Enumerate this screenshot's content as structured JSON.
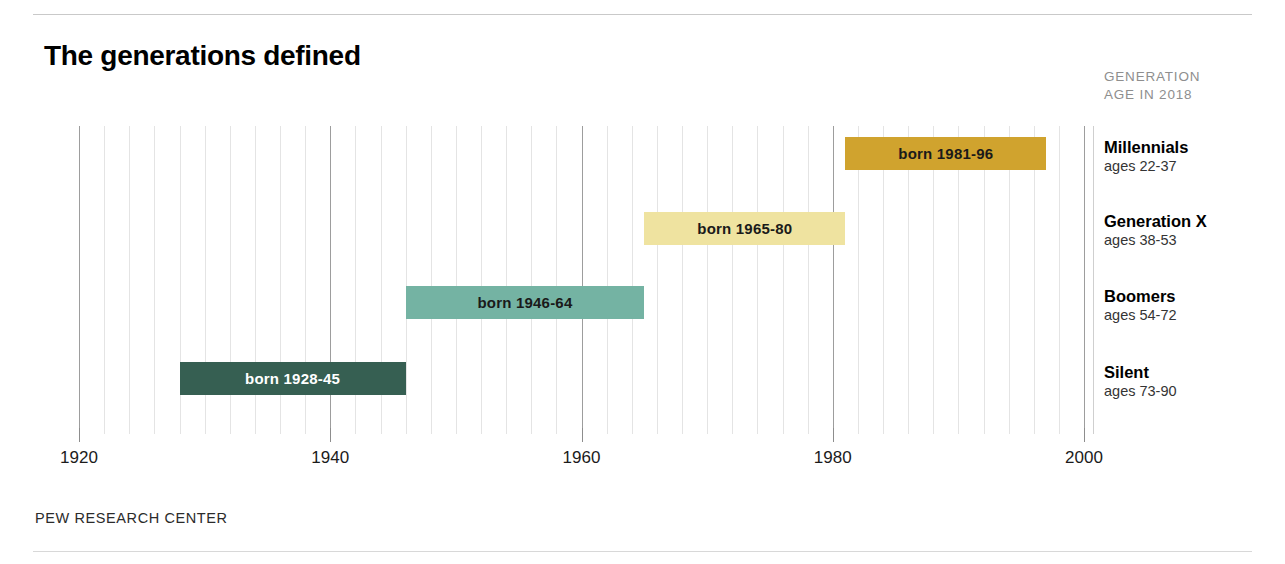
{
  "header": {
    "title": "The generations defined",
    "column_header_line1": "GENERATION",
    "column_header_line2": "AGE IN 2018"
  },
  "footer": {
    "source": "PEW RESEARCH CENTER"
  },
  "chart_data": {
    "type": "bar",
    "orientation": "horizontal",
    "title": "The generations defined",
    "xlabel": "",
    "ylabel": "",
    "xlim": [
      1920,
      2000
    ],
    "xticks": [
      1920,
      1940,
      1960,
      1980,
      2000
    ],
    "xtick_labels": [
      "1920",
      "1940",
      "1960",
      "1980",
      "2000"
    ],
    "grid": true,
    "grid_minor_step": 2,
    "grid_major_step": 20,
    "legend": "none",
    "categories": [
      "Millennials",
      "Generation X",
      "Boomers",
      "Silent"
    ],
    "bars": [
      {
        "generation": "Millennials",
        "label": "born 1981-96",
        "start": 1981,
        "end": 1996,
        "ages": "ages 22-37",
        "color": "#d0a32e",
        "text_color": "#1a1a1a"
      },
      {
        "generation": "Generation X",
        "label": "born 1965-80",
        "start": 1965,
        "end": 1980,
        "ages": "ages 38-53",
        "color": "#efe3a0",
        "text_color": "#1a1a1a"
      },
      {
        "generation": "Boomers",
        "label": "born 1946-64",
        "start": 1946,
        "end": 1964,
        "ages": "ages 54-72",
        "color": "#74b3a3",
        "text_color": "#1a1a1a"
      },
      {
        "generation": "Silent",
        "label": "born 1928-45",
        "start": 1928,
        "end": 1945,
        "ages": "ages 73-90",
        "color": "#365f52",
        "text_color": "#ffffff"
      }
    ]
  }
}
